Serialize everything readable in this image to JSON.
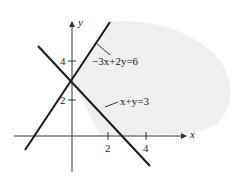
{
  "diagram": {
    "type": "linear-inequality-graph",
    "axes": {
      "x_label": "x",
      "y_label": "y",
      "x_ticks": [
        "2",
        "4"
      ],
      "y_ticks": [
        "2",
        "4"
      ]
    },
    "lines": [
      {
        "equation": "−3x+2y=6",
        "label": "−3x+2y=6"
      },
      {
        "equation": "x+y=3",
        "label": "x+y=3"
      }
    ],
    "shaded_region": "right of both lines, above x+y=3 and below −3x+2y=6",
    "colors": {
      "line": "#1a1a1a",
      "axis": "#333333",
      "shade": "#f0f0f0"
    }
  }
}
